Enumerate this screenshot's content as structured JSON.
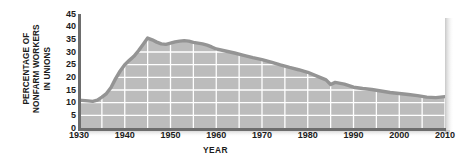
{
  "chart_data": {
    "type": "area",
    "title": "",
    "xlabel": "YEAR",
    "ylabel": "PERCENTAGE OF NONFARM WORKERS IN UNIONS",
    "ylabel_lines": [
      "PERCENTAGE OF",
      "NONFARM WORKERS",
      "IN UNIONS"
    ],
    "xlim": [
      1930,
      2010
    ],
    "ylim": [
      0,
      45
    ],
    "ytick_values": [
      0,
      5,
      10,
      15,
      20,
      25,
      30,
      35,
      40,
      45
    ],
    "ytick_labels": [
      "0",
      "5",
      "10",
      "15",
      "20",
      "25",
      "30",
      "35",
      "40",
      "45"
    ],
    "xtick_values": [
      1930,
      1940,
      1950,
      1960,
      1970,
      1980,
      1990,
      2000,
      2010
    ],
    "xtick_labels": [
      "1930",
      "1940",
      "1950",
      "1960",
      "1970",
      "1980",
      "1990",
      "2000",
      "2010"
    ],
    "grid": true,
    "grid_color": "#ffffff",
    "legend": null,
    "series": [
      {
        "name": "Percentage of nonfarm workers in unions",
        "line_color": "#949494",
        "fill_color": "#bcbcbc",
        "x": [
          1930,
          1932,
          1933,
          1934,
          1935,
          1936,
          1937,
          1938,
          1939,
          1940,
          1941,
          1942,
          1943,
          1944,
          1945,
          1946,
          1947,
          1948,
          1949,
          1950,
          1951,
          1952,
          1953,
          1954,
          1955,
          1956,
          1957,
          1958,
          1959,
          1960,
          1962,
          1964,
          1966,
          1968,
          1970,
          1972,
          1974,
          1976,
          1978,
          1980,
          1982,
          1984,
          1985,
          1986,
          1988,
          1990,
          1992,
          1994,
          1996,
          1998,
          2000,
          2002,
          2004,
          2006,
          2008,
          2010
        ],
        "y": [
          11.0,
          10.7,
          10.5,
          11.0,
          12.2,
          13.6,
          16.0,
          19.5,
          22.5,
          25.0,
          26.7,
          28.3,
          30.5,
          33.0,
          35.5,
          34.8,
          33.9,
          33.2,
          33.0,
          33.5,
          34.0,
          34.3,
          34.5,
          34.3,
          33.8,
          33.5,
          33.2,
          32.7,
          32.0,
          31.2,
          30.4,
          29.6,
          28.7,
          27.8,
          27.0,
          26.0,
          24.9,
          23.9,
          23.0,
          22.0,
          20.5,
          19.0,
          17.2,
          18.0,
          17.3,
          16.1,
          15.6,
          15.2,
          14.6,
          14.0,
          13.6,
          13.2,
          12.8,
          12.2,
          12.0,
          12.4
        ]
      }
    ]
  },
  "figure": {
    "background": "#ffffff",
    "plot_background": "#ffffff",
    "axis_color": "#6d6d6d",
    "text_color": "#1b1b1b"
  }
}
